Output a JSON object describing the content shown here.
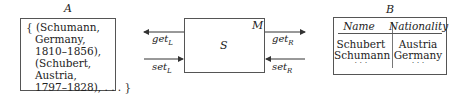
{
  "diagram": {
    "set_A": {
      "label": "A",
      "lines": [
        "{ (Schumann,",
        "Germany,",
        "1810–1856),",
        "(Schubert,",
        "Austria,",
        "1797–1828), . . . }"
      ]
    },
    "module": {
      "label": "M",
      "state": "S",
      "left_arrows": [
        {
          "name": "get",
          "sub": "L",
          "direction": "out-left"
        },
        {
          "name": "set",
          "sub": "L",
          "direction": "in-right"
        }
      ],
      "right_arrows": [
        {
          "name": "get",
          "sub": "R",
          "direction": "out-right"
        },
        {
          "name": "set",
          "sub": "R",
          "direction": "in-left"
        }
      ]
    },
    "table_B": {
      "label": "B",
      "headers": [
        "Name",
        "Nationality"
      ],
      "rows": [
        [
          "Schubert",
          "Austria"
        ],
        [
          "Schumann",
          "Germany"
        ],
        [
          "· · ·",
          "· · ·"
        ]
      ]
    }
  }
}
